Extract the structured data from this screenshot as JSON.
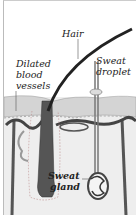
{
  "diagram": {
    "labels": {
      "hair": "Hair",
      "sweat_droplet_1": "Sweat",
      "sweat_droplet_2": "droplet",
      "dilated_1": "Dilated",
      "dilated_2": "blood",
      "dilated_3": "vessels",
      "sweat_gland_1": "Sweat",
      "sweat_gland_2": "gland"
    },
    "colors": {
      "background": "#ffffff",
      "epidermis": "#d6d6d6",
      "dermis": "#ececec",
      "vessel": "#4a4a4a",
      "hair": "#2a2a2a"
    }
  }
}
